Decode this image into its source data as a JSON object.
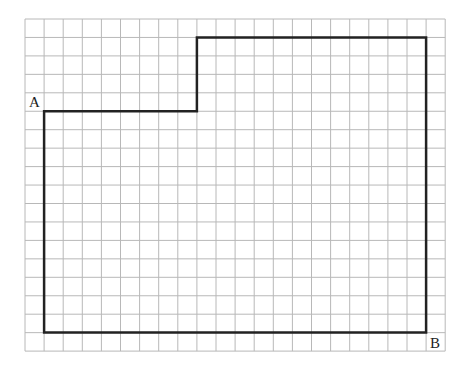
{
  "grid": {
    "columns": 22,
    "rows": 18,
    "origin_x": 25,
    "origin_y": 19,
    "cell_width": 19.1,
    "cell_height": 18.45,
    "line_color": "#b8b8b8",
    "outline_color": "#222222"
  },
  "shape": {
    "name": "boundary-path",
    "vertices_grid": [
      [
        1,
        5
      ],
      [
        9,
        5
      ],
      [
        9,
        1
      ],
      [
        21,
        1
      ],
      [
        21,
        17
      ],
      [
        1,
        17
      ]
    ]
  },
  "labels": {
    "point_a": "A",
    "point_b": "B"
  }
}
